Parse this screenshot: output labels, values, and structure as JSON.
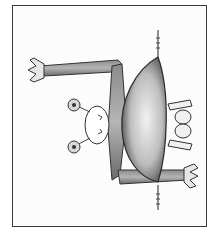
{
  "image": {
    "subject": "pencil drawing of a whimsical creature, rotated sideways, inside a rectangular border",
    "elements": [
      "border-frame",
      "body",
      "head-with-eye-stalks",
      "upper-arm",
      "lower-arm",
      "feet",
      "antennae"
    ]
  },
  "colors": {
    "border": "#3a3a3a",
    "ink": "#2a2a2a",
    "shade_dark": "#555555",
    "shade_light": "#e6e6e6",
    "paper": "#fcfcfc"
  }
}
